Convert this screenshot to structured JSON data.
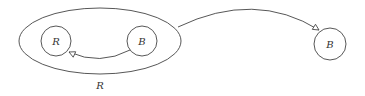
{
  "diagram": {
    "group": {
      "label": "R"
    },
    "nodes": [
      {
        "id": "inner-r",
        "label": "R"
      },
      {
        "id": "inner-b",
        "label": "B"
      },
      {
        "id": "outer-b",
        "label": "B"
      }
    ],
    "edges": [
      {
        "from": "inner-b",
        "to": "inner-r"
      },
      {
        "from": "group",
        "to": "outer-b"
      }
    ],
    "colors": {
      "stroke": "#444444",
      "background": "#ffffff"
    }
  }
}
